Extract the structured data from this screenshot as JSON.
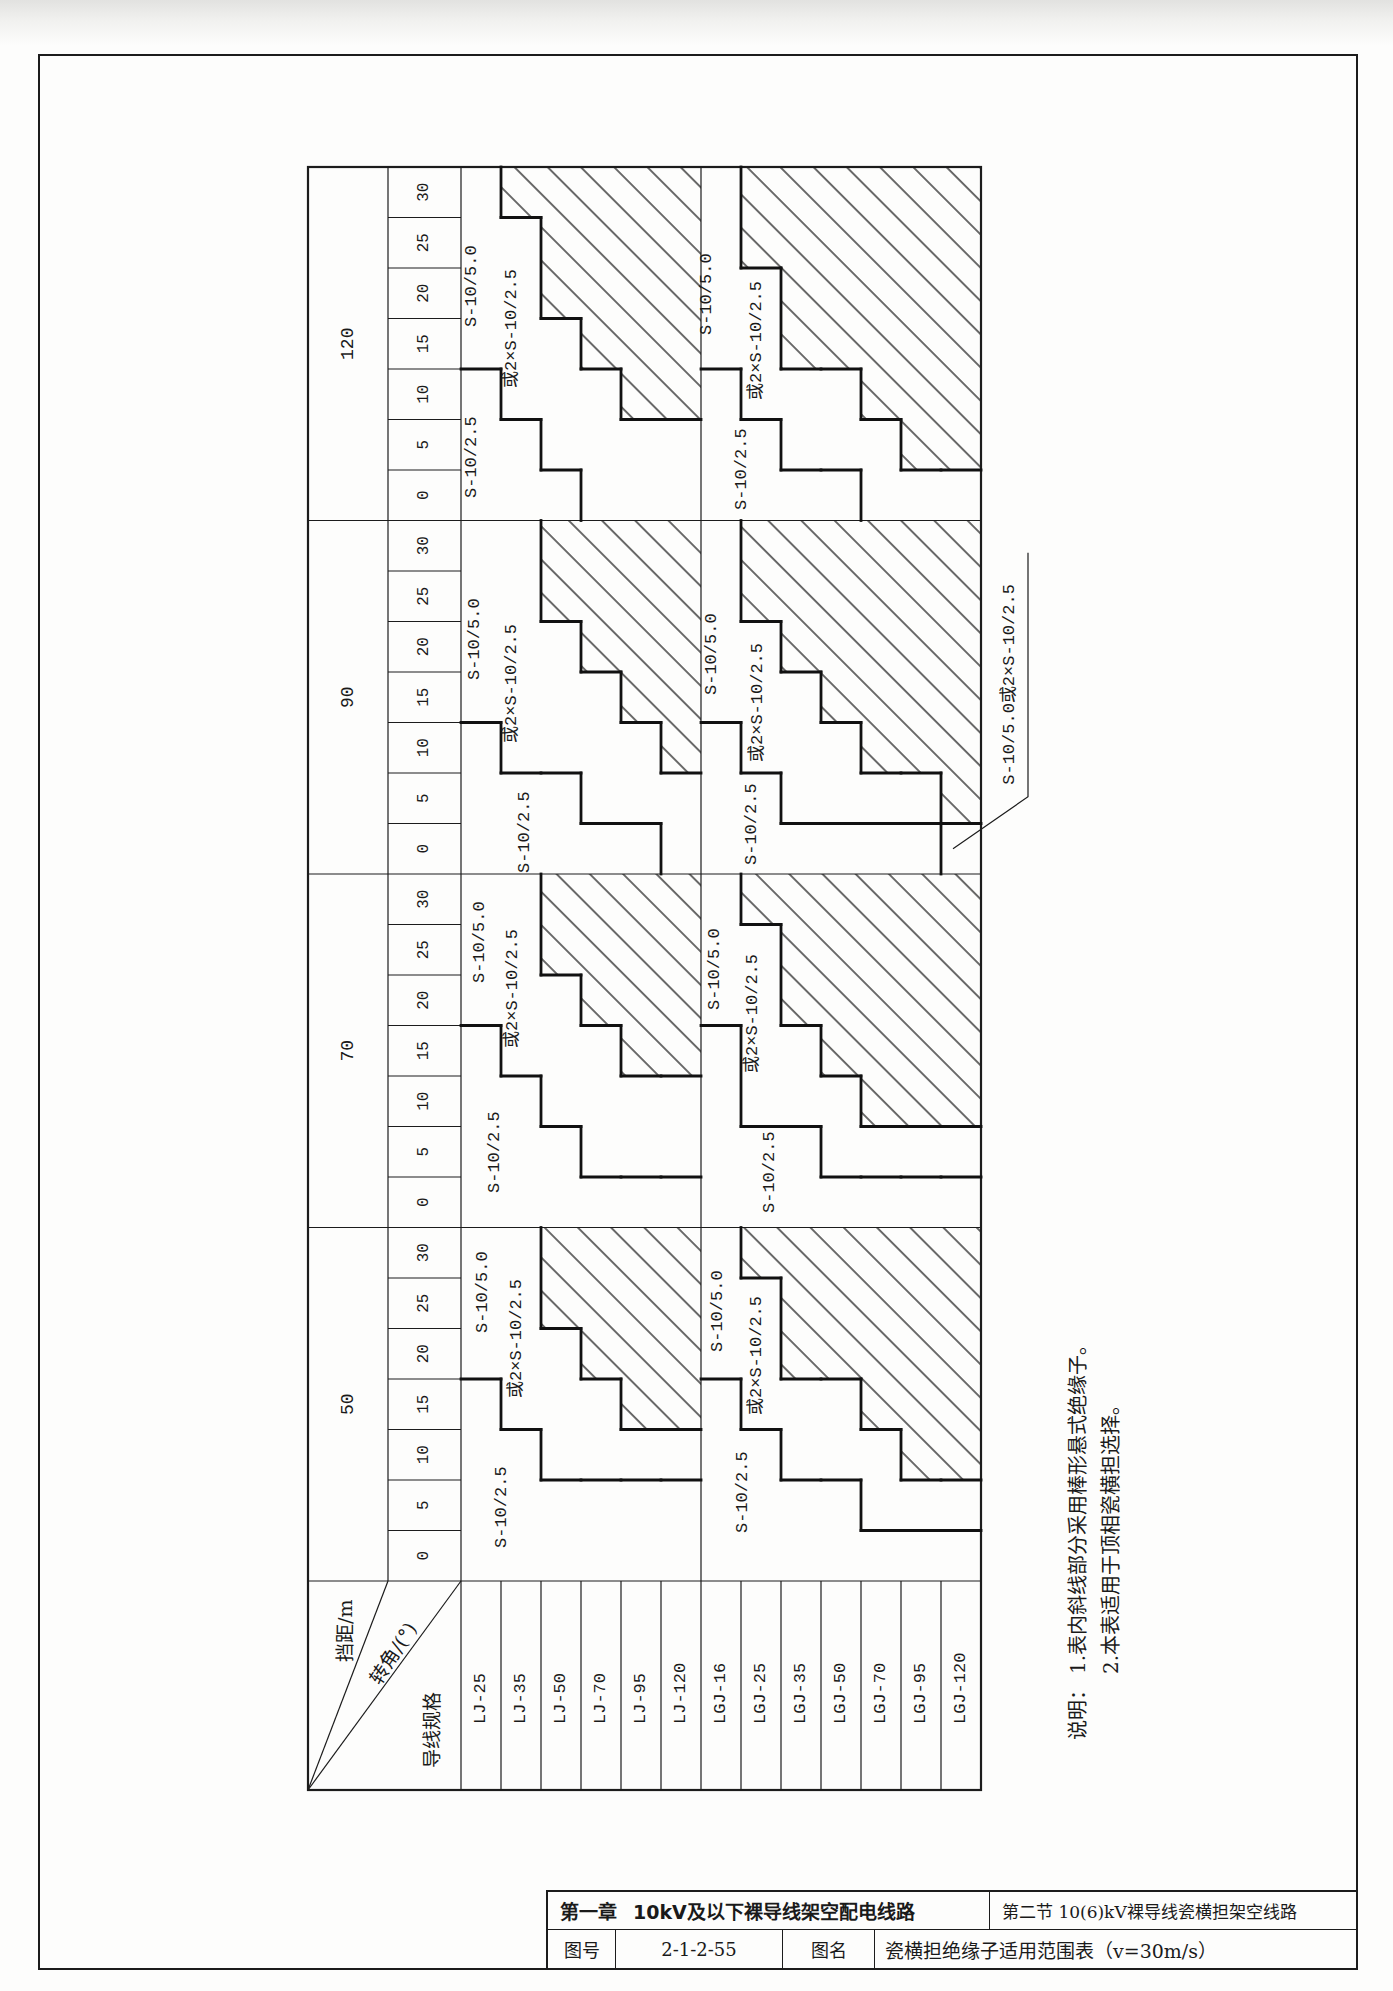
{
  "table": {
    "corner_header": {
      "span_label": "挡距/m",
      "angle_label": "转角/(°)",
      "conductor_label": "导线规格"
    },
    "spans": [
      "50",
      "70",
      "90",
      "120"
    ],
    "angles": [
      "0",
      "5",
      "10",
      "15",
      "20",
      "25",
      "30"
    ],
    "conductors": [
      "LJ-25",
      "LJ-35",
      "LJ-50",
      "LJ-70",
      "LJ-95",
      "LJ-120",
      "LGJ-16",
      "LGJ-25",
      "LGJ-35",
      "LGJ-50",
      "LGJ-70",
      "LGJ-95",
      "LGJ-120"
    ],
    "region_labels": {
      "A": "S-10/2.5",
      "B_line1": "S-10/5.0",
      "B_line2": "或2×S-10/2.5"
    },
    "legend": {
      "A": "S-10/2.5",
      "B": "S-10/5.0或2×S-10/2.5",
      "H": "斜线部分（棒形悬式绝缘子）"
    },
    "ranges": [
      {
        "span": "50",
        "cells": {
          "LJ-25": "AAAABBB",
          "LJ-35": "AAABBBB",
          "LJ-50": "AABBBHH",
          "LJ-70": "AABBHHH",
          "LJ-95": "AABHHHH",
          "LJ-120": "AABHHHH",
          "LGJ-16": "AAAABBB",
          "LGJ-25": "AAABBBH",
          "LGJ-35": "AABBHHH",
          "LGJ-50": "AABBHHH",
          "LGJ-70": "ABBHHHH",
          "LGJ-95": "ABHHHHH",
          "LGJ-120": "ABHHHHH"
        }
      },
      {
        "span": "70",
        "cells": {
          "LJ-25": "AAAABBB",
          "LJ-35": "AAABBBB",
          "LJ-50": "AABBBHH",
          "LJ-70": "ABBBHHH",
          "LJ-95": "ABBHHHH",
          "LJ-120": "ABBHHHH",
          "LGJ-16": "AAAABBB",
          "LGJ-25": "AABBBBH",
          "LGJ-35": "AABBHHH",
          "LGJ-50": "ABBHHHH",
          "LGJ-70": "ABHHHHH",
          "LGJ-95": "ABHHHHH",
          "LGJ-120": "ABHHHHH"
        }
      },
      {
        "span": "90",
        "cells": {
          "LJ-25": "AAABBBB",
          "LJ-35": "AABBBBB",
          "LJ-50": "AABBBHH",
          "LJ-70": "ABBBHHH",
          "LJ-95": "ABBHHHH",
          "LJ-120": "BBHHHHH",
          "LGJ-16": "AAABBBB",
          "LGJ-25": "AABBBHH",
          "LGJ-35": "ABBBHHH",
          "LGJ-50": "ABBHHHH",
          "LGJ-70": "ABHHHHH",
          "LGJ-95": "ABHHHHH",
          "LGJ-120": "BHHHHHH"
        }
      },
      {
        "span": "120",
        "cells": {
          "LJ-25": "AAABBBB",
          "LJ-35": "AABBBBH",
          "LJ-50": "ABBBHHH",
          "LJ-70": "BBBHHHH",
          "LJ-95": "BBHHHHH",
          "LJ-120": "BBHHHHH",
          "LGJ-16": "AAABBBB",
          "LGJ-25": "AABBBHH",
          "LGJ-35": "ABBHHHH",
          "LGJ-50": "ABBHHHH",
          "LGJ-70": "BBHHHHH",
          "LGJ-95": "BHHHHHH",
          "LGJ-120": "BHHHHHH"
        }
      }
    ],
    "callout": {
      "text": "S-10/5.0或2×S-10/2.5",
      "span": "90",
      "conductor": "LGJ-120",
      "angle": "0"
    }
  },
  "notes": {
    "heading": "说明：",
    "items": [
      "1.表内斜线部分采用棒形悬式绝缘子。",
      "2.本表适用于顶相瓷横担选择。"
    ]
  },
  "title_block": {
    "chapter": "第一章",
    "chapter_title": "10kV及以下裸导线架空配电线路",
    "section": "第二节  10(6)kV裸导线瓷横担架空线路",
    "drawing_no_label": "图号",
    "drawing_no": "2-1-2-55",
    "drawing_name_label": "图名",
    "drawing_name": "瓷横担绝缘子适用范围表（v=30m/s）"
  }
}
